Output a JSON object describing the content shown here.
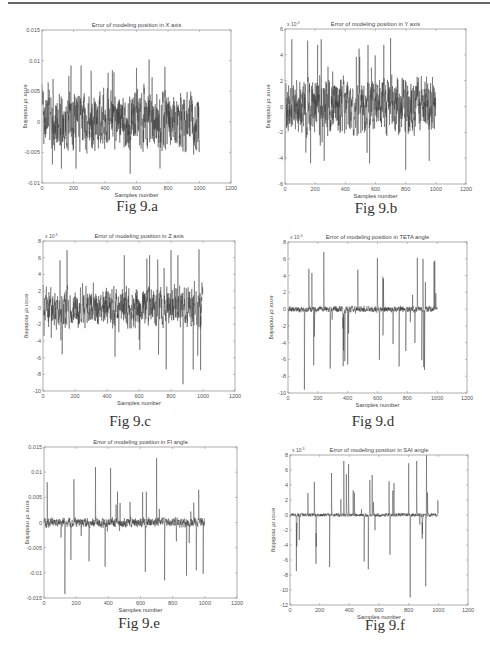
{
  "page": {
    "top_rule": true
  },
  "figures": [
    {
      "id": "a",
      "caption": "Fig 9.a"
    },
    {
      "id": "b",
      "caption": "Fig 9.b"
    },
    {
      "id": "c",
      "caption": "Fig 9.c"
    },
    {
      "id": "d",
      "caption": "Fig 9.d"
    },
    {
      "id": "e",
      "caption": "Fig 9.e"
    },
    {
      "id": "f",
      "caption": "Fig 9.f"
    }
  ],
  "chart_data": [
    {
      "type": "line",
      "title": "Error of modeling position in X axis",
      "xlabel": "Samples number",
      "ylabel": "error of modeling",
      "xlim": [
        0,
        1200
      ],
      "ylim": [
        -0.01,
        0.015
      ],
      "xticks": [
        "0",
        "200",
        "400",
        "600",
        "800",
        "1000",
        "1200"
      ],
      "yticks": [
        "-0.01",
        "-0.005",
        "0",
        "0.005",
        "0.01",
        "0.015"
      ],
      "y_multiplier": "",
      "grid": false,
      "series": [
        {
          "name": "error",
          "n": 1000,
          "envelope_min": -0.0085,
          "envelope_max": 0.0102,
          "typical_amplitude": 0.004,
          "peaks": [
            [
              70,
              0.007
            ],
            [
              170,
              0.0075
            ],
            [
              420,
              0.008
            ],
            [
              560,
              -0.0085
            ],
            [
              680,
              0.0102
            ],
            [
              780,
              0.009
            ],
            [
              600,
              0.0088
            ]
          ]
        }
      ],
      "caption": "Fig 9.a"
    },
    {
      "type": "line",
      "title": "Error of modeling position in Y axis",
      "xlabel": "Samples number",
      "ylabel": "error of modeling",
      "xlim": [
        0,
        1200
      ],
      "ylim": [
        -6,
        6
      ],
      "xticks": [
        "0",
        "200",
        "400",
        "600",
        "800",
        "1000",
        "1200"
      ],
      "yticks": [
        "-6",
        "-4",
        "-2",
        "0",
        "2",
        "4",
        "6"
      ],
      "y_multiplier": "x 10^-3",
      "grid": false,
      "series": [
        {
          "name": "error",
          "n": 1000,
          "envelope_min": -4.9,
          "envelope_max": 5.3,
          "typical_amplitude": 1.8,
          "peaks": [
            [
              45,
              5.2
            ],
            [
              150,
              5.1
            ],
            [
              240,
              5.2
            ],
            [
              700,
              5.3
            ],
            [
              800,
              -4.9
            ],
            [
              170,
              -4.4
            ],
            [
              260,
              -4.2
            ]
          ]
        }
      ],
      "caption": "Fig 9.b"
    },
    {
      "type": "line",
      "title": "Error of modeling position in Z axis",
      "xlabel": "Samples number",
      "ylabel": "error of modeling",
      "xlim": [
        0,
        1200
      ],
      "ylim": [
        -10,
        8
      ],
      "xticks": [
        "0",
        "200",
        "400",
        "600",
        "800",
        "1000",
        "1200"
      ],
      "yticks": [
        "-10",
        "-8",
        "-6",
        "-4",
        "-2",
        "0",
        "2",
        "4",
        "6",
        "8"
      ],
      "y_multiplier": "x 10^-3",
      "grid": false,
      "series": [
        {
          "name": "error",
          "n": 1000,
          "envelope_min": -9.2,
          "envelope_max": 7.0,
          "typical_amplitude": 2.0,
          "peaks": [
            [
              150,
              6.9
            ],
            [
              800,
              6.9
            ],
            [
              975,
              7.0
            ],
            [
              875,
              -9.2
            ],
            [
              770,
              -7.4
            ],
            [
              120,
              -5.6
            ],
            [
              450,
              -5.9
            ]
          ]
        }
      ],
      "caption": "Fig 9.c"
    },
    {
      "type": "line",
      "title": "Error of modeling position in TETA angle",
      "xlabel": "Samples number",
      "ylabel": "error of modeling",
      "xlim": [
        0,
        1200
      ],
      "ylim": [
        -10,
        8
      ],
      "xticks": [
        "0",
        "200",
        "400",
        "600",
        "800",
        "1000",
        "1200"
      ],
      "yticks": [
        "-10",
        "-8",
        "-6",
        "-4",
        "-2",
        "0",
        "2",
        "4",
        "6",
        "8"
      ],
      "y_multiplier": "x 10^-3",
      "grid": false,
      "series": [
        {
          "name": "error",
          "n": 1000,
          "envelope_min": -9.6,
          "envelope_max": 6.8,
          "typical_amplitude": 0.3,
          "peaks": [
            [
              110,
              -9.6
            ],
            [
              240,
              6.8
            ],
            [
              140,
              4.8
            ],
            [
              370,
              -6.8
            ],
            [
              400,
              -6.6
            ],
            [
              905,
              6.0
            ],
            [
              910,
              -6.9
            ],
            [
              640,
              3.6
            ],
            [
              790,
              -5.0
            ]
          ]
        }
      ],
      "caption": "Fig 9.d"
    },
    {
      "type": "line",
      "title": "Error of modeling position in FI angle",
      "xlabel": "Samples number",
      "ylabel": "error of modeling",
      "xlim": [
        0,
        1200
      ],
      "ylim": [
        -0.015,
        0.015
      ],
      "xticks": [
        "0",
        "200",
        "400",
        "600",
        "800",
        "1000",
        "1200"
      ],
      "yticks": [
        "-0.015",
        "-0.01",
        "-0.005",
        "0",
        "0.005",
        "0.01",
        "0.015"
      ],
      "y_multiplier": "",
      "grid": false,
      "series": [
        {
          "name": "error",
          "n": 1000,
          "envelope_min": -0.0142,
          "envelope_max": 0.0128,
          "typical_amplitude": 0.0008,
          "peaks": [
            [
              130,
              -0.0142
            ],
            [
              700,
              0.0128
            ],
            [
              320,
              0.011
            ],
            [
              750,
              -0.0115
            ],
            [
              630,
              -0.0098
            ],
            [
              990,
              -0.0102
            ],
            [
              20,
              0.008
            ],
            [
              380,
              -0.0088
            ]
          ]
        }
      ],
      "caption": "Fig 9.e"
    },
    {
      "type": "line",
      "title": "Error of modeling position in SAI angle",
      "xlabel": "Samples number",
      "ylabel": "error of modeling",
      "xlim": [
        0,
        1200
      ],
      "ylim": [
        -12,
        8
      ],
      "xticks": [
        "0",
        "200",
        "400",
        "600",
        "800",
        "1000",
        "1200"
      ],
      "yticks": [
        "-12",
        "-10",
        "-8",
        "-6",
        "-4",
        "-2",
        "0",
        "2",
        "4",
        "6",
        "8"
      ],
      "y_multiplier": "x 10^-3",
      "grid": false,
      "series": [
        {
          "name": "error",
          "n": 1000,
          "envelope_min": -11.0,
          "envelope_max": 8.0,
          "typical_amplitude": 0.2,
          "peaks": [
            [
              920,
              8.0
            ],
            [
              810,
              -11.0
            ],
            [
              915,
              -9.5
            ],
            [
              395,
              6.8
            ],
            [
              280,
              5.6
            ],
            [
              800,
              6.9
            ],
            [
              500,
              -6.2
            ],
            [
              175,
              -6.5
            ]
          ]
        }
      ],
      "caption": "Fig 9.f"
    }
  ]
}
